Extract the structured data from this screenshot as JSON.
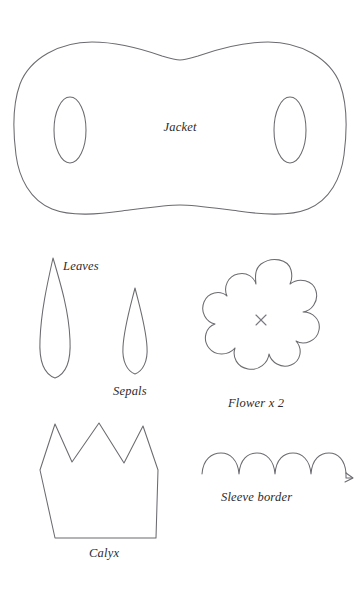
{
  "document": {
    "type": "sewing-pattern-sheet",
    "title": "Pattern pieces",
    "background_color": "#ffffff",
    "ink_color": "#6b6b70",
    "label_color": "#2b2b2e"
  },
  "pieces": [
    {
      "id": "jacket",
      "label": "Jacket",
      "shape": "rounded-rectangular-body-with-two-armholes",
      "label_x": 180,
      "label_y": 131,
      "detail": "wide bone-shaped body panel with concave top and bottom centers and two vertical oval armhole cut-outs"
    },
    {
      "id": "leaves",
      "label": "Leaves",
      "shape": "elongated-pointed-leaf",
      "label_x": 63,
      "label_y": 270,
      "detail": "tall narrow leaf, sharp point at top, rounded base"
    },
    {
      "id": "sepals",
      "label": "Sepals",
      "shape": "small-pointed-leaf",
      "label_x": 113,
      "label_y": 395,
      "detail": "smaller pointed teardrop leaf shape"
    },
    {
      "id": "flower",
      "label": "Flower x 2",
      "shape": "seven-petal-blossom",
      "label_x": 228,
      "label_y": 407,
      "detail": "rounded seven-petal flower outline with small x mark at centre",
      "quantity": 2,
      "center_mark": "x"
    },
    {
      "id": "calyx",
      "label": "Calyx",
      "shape": "three-point-crown",
      "label_x": 89,
      "label_y": 557,
      "detail": "crown shape with three triangular points and flat base"
    },
    {
      "id": "sleeve-border",
      "label": "Sleeve border",
      "shape": "scalloped-strip-with-arrow",
      "label_x": 221,
      "label_y": 501,
      "detail": "row of five scallops continuing into a straight line ending in an arrowhead",
      "scallop_count": 5
    }
  ]
}
